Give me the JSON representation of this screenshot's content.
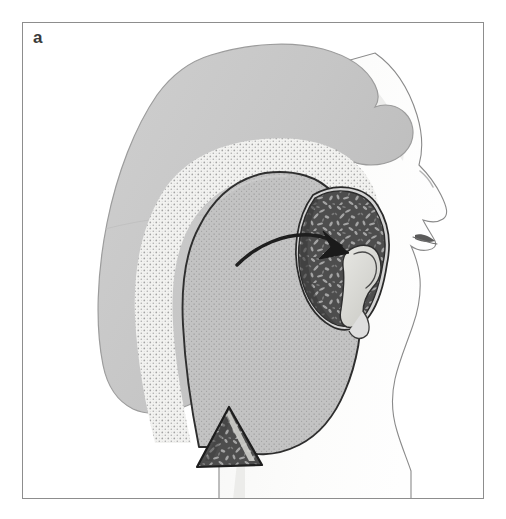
{
  "figure": {
    "panel_label": "a",
    "domain_note": "anatomical line illustration, lateral head view",
    "caption_visible": false
  },
  "frame": {
    "border_color": "#8d8d8d",
    "background_color": "#ffffff",
    "x": 22,
    "y": 22,
    "width": 462,
    "height": 477
  },
  "colors": {
    "scalp_gray": "#c7c7c7",
    "scalp_outline": "#9a9a9a",
    "stipple_band_base": "#f0f0ee",
    "stipple_band_dots": "#9e9e9e",
    "flap_base": "#c2c2c2",
    "flap_dots": "#8f8f8f",
    "flap_outline": "#2c2c2c",
    "ear_dark": "#4a4a4a",
    "ear_texture_light": "#b9b9b9",
    "ear_rim_highlight": "#d8d8d8",
    "ear_rim_outline": "#2a2a2a",
    "concha_light": "#d9d9d5",
    "face_skin": "#fbfbfa",
    "face_outline": "#7b7b7b",
    "face_shadow": "#eeeeec",
    "graft_dark": "#565656",
    "graft_outline": "#1f1f1f",
    "graft_highlight": "#d0d0cc",
    "arrow_color": "#1e1e1e",
    "label_color": "#3a3a3a",
    "lip_dark": "#555555"
  },
  "elements": {
    "scalp": {
      "name": "scalp-silhouette",
      "description": "large gray scalp / hair silhouette occupying upper left two thirds"
    },
    "stipple_band": {
      "name": "stippled-donor-region",
      "description": "light coarse-stippled crescent band marking the donor/undermined area"
    },
    "flap": {
      "name": "temporoparietal-fascia-flap",
      "description": "gray finely stippled teardrop flap outlined in dark ink"
    },
    "ear": {
      "name": "auricle-cartilage-framework",
      "description": "dark mottled C-shaped ear cartilage framework with light helical rim and light concha"
    },
    "graft": {
      "name": "triangular-cartilage-graft",
      "description": "small dark mottled triangular graft at inferior end of the flap"
    },
    "arrow": {
      "name": "transposition-arrow",
      "description": "curved black arrow sweeping right and downward from flap into auricle"
    },
    "face": {
      "name": "face-profile",
      "description": "pale right-facing profile: forehead, brow, nose, lips, chin, jaw, neck"
    }
  },
  "annotations": {
    "arrow_start": {
      "x": 237,
      "y": 240
    },
    "arrow_end": {
      "x": 323,
      "y": 233
    },
    "arrow_direction": "flap rotated anteriorly into auricular defect"
  }
}
